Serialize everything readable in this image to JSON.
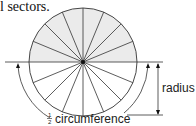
{
  "caption": "l sectors.",
  "diagram": {
    "sector_count": 16,
    "shaded_half": "top",
    "labels": {
      "radius": "radius",
      "fraction_num": "1",
      "fraction_den": "2",
      "circumference": "circumference"
    },
    "colors": {
      "line": "#333333",
      "shade": "#ebebeb",
      "background": "#ffffff"
    }
  }
}
